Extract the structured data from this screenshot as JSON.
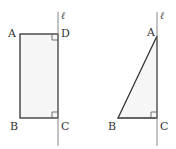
{
  "colors": {
    "stroke": "#333333",
    "line_l": "#888888",
    "fill": "#f6f6f6",
    "text": "#333333"
  },
  "figures": [
    {
      "name": "rectangle-ABCD",
      "shape": "rectangle",
      "line_label": "ℓ",
      "vertices": {
        "A": {
          "label": "A",
          "x": 20,
          "y": 34
        },
        "D": {
          "label": "D",
          "x": 58,
          "y": 34
        },
        "B": {
          "label": "B",
          "x": 20,
          "y": 118
        },
        "C": {
          "label": "C",
          "x": 58,
          "y": 118
        }
      },
      "right_angles": [
        "D",
        "C"
      ]
    },
    {
      "name": "triangle-ABC",
      "shape": "right-triangle",
      "line_label": "ℓ",
      "vertices": {
        "A": {
          "label": "A",
          "x": 157,
          "y": 36
        },
        "B": {
          "label": "B",
          "x": 118,
          "y": 118
        },
        "C": {
          "label": "C",
          "x": 157,
          "y": 118
        }
      },
      "right_angles": [
        "C"
      ]
    }
  ]
}
